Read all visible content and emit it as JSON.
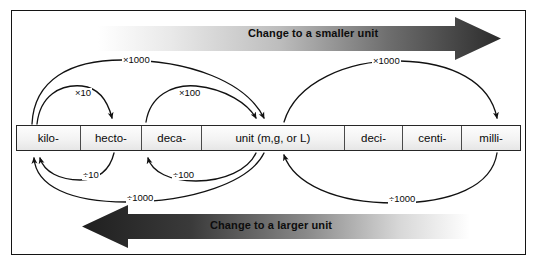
{
  "figure": {
    "title_alt": "Metric unit conversion chart"
  },
  "banners": {
    "top": {
      "label": "Change to a smaller unit",
      "direction": "right",
      "gradient_from": "#ffffff",
      "gradient_to": "#2b2b2b"
    },
    "bottom": {
      "label": "Change to a larger unit",
      "direction": "left",
      "gradient_from": "#1f1f1f",
      "gradient_to": "#ffffff"
    }
  },
  "scale": {
    "cells": [
      {
        "label": "kilo-",
        "width": 66
      },
      {
        "label": "hecto-",
        "width": 64
      },
      {
        "label": "deca-",
        "width": 62
      },
      {
        "label": "unit (m,g, or L)",
        "width": 148
      },
      {
        "label": "deci-",
        "width": 61
      },
      {
        "label": "centi-",
        "width": 61
      },
      {
        "label": "milli-",
        "width": 60
      }
    ]
  },
  "multiply_arcs": [
    {
      "name": "kilo-to-hecto",
      "label": "×10",
      "label_x": 74,
      "label_y": 88
    },
    {
      "name": "deca-to-unit",
      "label": "×100",
      "label_x": 178,
      "label_y": 88
    },
    {
      "name": "kilo-to-unit",
      "label": "×1000",
      "label_x": 122,
      "label_y": 64
    },
    {
      "name": "unit-to-milli",
      "label": "×1000",
      "label_x": 372,
      "label_y": 64
    }
  ],
  "divide_arcs": [
    {
      "name": "hecto-to-kilo",
      "label": "÷10",
      "label_x": 82,
      "label_y": 168
    },
    {
      "name": "unit-to-deca",
      "label": "÷100",
      "label_x": 172,
      "label_y": 168
    },
    {
      "name": "unit-to-kilo",
      "label": "÷1000",
      "label_x": 126,
      "label_y": 191
    },
    {
      "name": "milli-to-unit",
      "label": "÷1000",
      "label_x": 388,
      "label_y": 191
    }
  ],
  "colors": {
    "frame_border": "#141414",
    "cell_border": "#4a4a4a",
    "cell_fill": "#f1f1f1",
    "text": "#0a0a0a",
    "curve_stroke": "#111111"
  }
}
